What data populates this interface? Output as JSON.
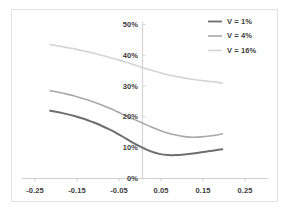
{
  "chart_data": {
    "type": "line",
    "title": "",
    "xlabel": "",
    "ylabel": "",
    "xlim": [
      -0.28,
      0.28
    ],
    "ylim": [
      0,
      0.52
    ],
    "grid": false,
    "legend_position": "top-right",
    "x_ticks": [
      "-0.25",
      "-0.15",
      "-0.05",
      "0.05",
      "0.15",
      "0.25"
    ],
    "x_tick_values": [
      -0.25,
      -0.15,
      -0.05,
      0.05,
      0.15,
      0.25
    ],
    "y_ticks": [
      "0%",
      "10%",
      "20%",
      "30%",
      "40%",
      "50%"
    ],
    "y_tick_values": [
      0,
      10,
      20,
      30,
      40,
      50
    ],
    "y_axis_position": "x=0",
    "series": [
      {
        "name": "V = 1%",
        "color": "#6e6e6e",
        "x": [
          -0.22,
          -0.2,
          -0.18,
          -0.16,
          -0.14,
          -0.12,
          -0.1,
          -0.08,
          -0.06,
          -0.04,
          -0.02,
          0.0,
          0.02,
          0.04,
          0.06,
          0.08,
          0.1,
          0.12,
          0.14,
          0.16,
          0.18,
          0.19
        ],
        "values": [
          22.0,
          21.5,
          20.9,
          20.2,
          19.4,
          18.4,
          17.3,
          16.0,
          14.6,
          13.0,
          11.4,
          10.0,
          8.8,
          8.0,
          7.6,
          7.6,
          7.8,
          8.1,
          8.5,
          8.9,
          9.3,
          9.5
        ]
      },
      {
        "name": "V = 4%",
        "color": "#a8a8a8",
        "x": [
          -0.22,
          -0.2,
          -0.18,
          -0.16,
          -0.14,
          -0.12,
          -0.1,
          -0.08,
          -0.06,
          -0.04,
          -0.02,
          0.0,
          0.02,
          0.04,
          0.06,
          0.08,
          0.1,
          0.12,
          0.14,
          0.16,
          0.18,
          0.19
        ],
        "values": [
          28.5,
          28.0,
          27.4,
          26.7,
          25.9,
          25.0,
          24.0,
          22.9,
          21.7,
          20.4,
          19.2,
          18.0,
          16.8,
          15.7,
          14.8,
          14.1,
          13.6,
          13.4,
          13.5,
          13.8,
          14.2,
          14.5
        ]
      },
      {
        "name": "V = 16%",
        "color": "#d4d4d4",
        "x": [
          -0.22,
          -0.2,
          -0.18,
          -0.16,
          -0.14,
          -0.12,
          -0.1,
          -0.08,
          -0.06,
          -0.04,
          -0.02,
          0.0,
          0.02,
          0.04,
          0.06,
          0.08,
          0.1,
          0.12,
          0.14,
          0.16,
          0.18,
          0.19
        ],
        "values": [
          43.5,
          43.0,
          42.5,
          42.0,
          41.4,
          40.8,
          40.1,
          39.4,
          38.6,
          37.8,
          36.9,
          36.0,
          35.2,
          34.4,
          33.7,
          33.1,
          32.6,
          32.2,
          31.8,
          31.5,
          31.2,
          31.0
        ]
      }
    ]
  },
  "legend": {
    "items": [
      {
        "label": "V = 1%",
        "color": "#6e6e6e"
      },
      {
        "label": "V = 4%",
        "color": "#a8a8a8"
      },
      {
        "label": "V = 16%",
        "color": "#d4d4d4"
      }
    ]
  },
  "axes": {
    "x_tick_labels": [
      "-0.25",
      "-0.15",
      "-0.05",
      "0.05",
      "0.15",
      "0.25"
    ],
    "y_tick_labels": [
      "50%",
      "40%",
      "30%",
      "20%",
      "10%",
      "0%"
    ]
  }
}
